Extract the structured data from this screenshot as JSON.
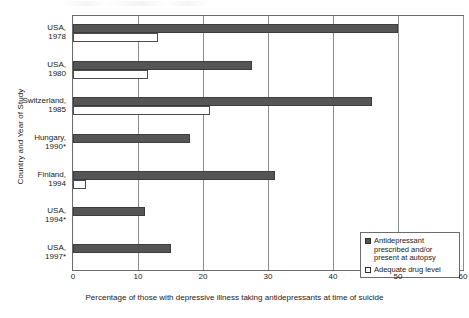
{
  "chart_data": {
    "type": "bar",
    "orientation": "horizontal",
    "title": "",
    "xlabel": "Percentage of those with depressive illness taking antidepressants at time of suicide",
    "ylabel": "Country and Year of Study",
    "xlim": [
      0,
      60
    ],
    "xticks": [
      0,
      10,
      20,
      30,
      40,
      50,
      60
    ],
    "xtick_labels": [
      "0",
      "10",
      "20",
      "30",
      "40",
      "50",
      "60"
    ],
    "grid": true,
    "legend_position": "bottom-right",
    "categories": [
      "USA, 1978",
      "USA, 1980",
      "Switzerland, 1985",
      "Hungary, 1990*",
      "Finland, 1994",
      "USA, 1994*",
      "USA, 1997*"
    ],
    "category_lines": [
      [
        "USA,",
        "1978"
      ],
      [
        "USA,",
        "1980"
      ],
      [
        "Switzerland,",
        "1985"
      ],
      [
        "Hungary,",
        "1990*"
      ],
      [
        "Finland,",
        "1994"
      ],
      [
        "USA,",
        "1994*"
      ],
      [
        "USA,",
        "1997*"
      ]
    ],
    "series": [
      {
        "name": "Antidepressant prescribed and/or present at autopsy",
        "color": "#555555",
        "values": [
          50,
          27.5,
          46,
          18,
          31,
          11,
          15
        ]
      },
      {
        "name": "Adequate drug level",
        "color": "#ffffff",
        "values": [
          13,
          11.5,
          21,
          null,
          2,
          null,
          null
        ]
      }
    ]
  },
  "legend": {
    "entries": [
      {
        "label": "Antidepressant prescribed and/or present at autopsy",
        "swatch": "dark-square-swatch"
      },
      {
        "label": "Adequate drug level",
        "swatch": "light-square-swatch"
      }
    ]
  },
  "colors": {
    "series_dark": "#555555",
    "series_light": "#ffffff",
    "axis": "#6b6b6b",
    "grid": "#8c8c8c",
    "text": "#1a1a1a"
  }
}
